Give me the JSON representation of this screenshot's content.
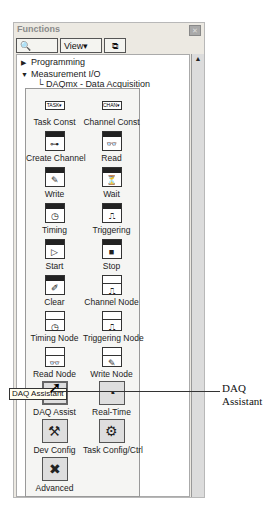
{
  "window": {
    "title": "Functions",
    "close_label": "✕"
  },
  "toolbar": {
    "search_label": "Search",
    "view_label": "View▾",
    "pin_glyph": "⧉"
  },
  "tree": {
    "items": [
      {
        "label": "Programming",
        "expanded": false,
        "glyph": "▶"
      },
      {
        "label": "Measurement I/O",
        "expanded": true,
        "glyph": "▼"
      },
      {
        "label": "└ DAQmx - Data Acquisition",
        "expanded": true
      }
    ]
  },
  "palette": {
    "items": [
      {
        "label": "Task Const",
        "icon": "task-const",
        "glyph": "TASK▾"
      },
      {
        "label": "Channel Const",
        "icon": "channel-const",
        "glyph": "CHAN▾"
      },
      {
        "label": "Create Channel",
        "icon": "create-channel",
        "glyph": "⊶"
      },
      {
        "label": "Read",
        "icon": "read",
        "glyph": "👓"
      },
      {
        "label": "Write",
        "icon": "write",
        "glyph": "✎"
      },
      {
        "label": "Wait",
        "icon": "wait",
        "glyph": "⏳"
      },
      {
        "label": "Timing",
        "icon": "timing",
        "glyph": "◷"
      },
      {
        "label": "Triggering",
        "icon": "triggering",
        "glyph": "⎍"
      },
      {
        "label": "Start",
        "icon": "start",
        "glyph": "▷"
      },
      {
        "label": "Stop",
        "icon": "stop",
        "glyph": "■"
      },
      {
        "label": "Clear",
        "icon": "clear",
        "glyph": "✐"
      },
      {
        "label": "Channel Node",
        "icon": "channel-node",
        "glyph": "⎍"
      },
      {
        "label": "Timing Node",
        "icon": "timing-node",
        "glyph": "◷"
      },
      {
        "label": "Triggering Node",
        "icon": "triggering-node",
        "glyph": "⎍"
      },
      {
        "label": "Read Node",
        "icon": "read-node",
        "glyph": "👓"
      },
      {
        "label": "Write Node",
        "icon": "write-node",
        "glyph": "✎"
      },
      {
        "label": "DAQ Assist",
        "icon": "daq-assistant",
        "glyph": "⚙"
      },
      {
        "label": "Real-Time",
        "icon": "real-time",
        "glyph": "◔"
      },
      {
        "label": "Dev Config",
        "icon": "dev-config",
        "glyph": "⚒"
      },
      {
        "label": "Task Config/Ctrl",
        "icon": "task-config",
        "glyph": "⚙"
      },
      {
        "label": "Advanced",
        "icon": "advanced",
        "glyph": "✖"
      }
    ]
  },
  "tooltip": "DAQ Assistant",
  "callout": {
    "line1": "DAQ",
    "line2": "Assistant"
  },
  "scrollbar": {
    "up_glyph": "▲"
  }
}
